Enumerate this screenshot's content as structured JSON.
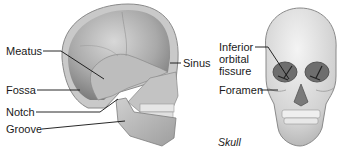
{
  "figure": {
    "caption": "Skull",
    "lateral_view": {
      "labels": [
        {
          "id": "meatus",
          "text": "Meatus"
        },
        {
          "id": "fossa",
          "text": "Fossa"
        },
        {
          "id": "notch",
          "text": "Notch"
        },
        {
          "id": "groove",
          "text": "Groove"
        },
        {
          "id": "sinus",
          "text": "Sinus"
        }
      ]
    },
    "anterior_view": {
      "labels": [
        {
          "id": "inferior-orbital-fissure",
          "lines": [
            "Inferior",
            "orbital",
            "fissure"
          ]
        },
        {
          "id": "foramen",
          "text": "Foramen"
        }
      ]
    }
  }
}
